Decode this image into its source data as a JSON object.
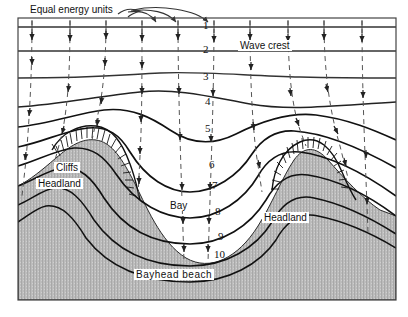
{
  "figure": {
    "type": "wave-refraction-diagram",
    "frame": {
      "x": 18,
      "y": 18,
      "width": 378,
      "height": 282
    }
  },
  "labels": {
    "equal_energy_units": "Equal energy units",
    "wave_crest": "Wave crest",
    "cliffs": "Cliffs",
    "headland_left": "Headland",
    "headland_right": "Headland",
    "bay": "Bay",
    "bayhead_beach": "Bayhead  beach"
  },
  "crest_numbers": [
    {
      "n": "1",
      "x": 203,
      "y": 20
    },
    {
      "n": "2",
      "x": 203,
      "y": 44
    },
    {
      "n": "3",
      "x": 203,
      "y": 71
    },
    {
      "n": "4",
      "x": 205,
      "y": 96
    },
    {
      "n": "5",
      "x": 205,
      "y": 123
    },
    {
      "n": "6",
      "x": 209,
      "y": 159
    },
    {
      "n": "7",
      "x": 212,
      "y": 180
    },
    {
      "n": "8",
      "x": 215,
      "y": 206
    },
    {
      "n": "9",
      "x": 218,
      "y": 231
    },
    {
      "n": "10",
      "x": 214,
      "y": 249
    }
  ],
  "colors": {
    "crest_line": "#1a1a1a",
    "orthogonal_dash": "#555555",
    "land_fill": "#b9b9b9",
    "frame": "#444444",
    "text": "#111111",
    "background": "#ffffff"
  },
  "chart_data": {
    "type": "line",
    "crest_count": 10,
    "crest_labels": [
      "1",
      "2",
      "3",
      "4",
      "5",
      "6",
      "7",
      "8",
      "9",
      "10"
    ],
    "orthogonal_count": 10,
    "features": [
      "Headland (left)",
      "Bay (centre)",
      "Headland (right)",
      "Cliffs",
      "Bayhead beach"
    ],
    "legend": [
      "Wave crest",
      "Equal energy units"
    ]
  }
}
